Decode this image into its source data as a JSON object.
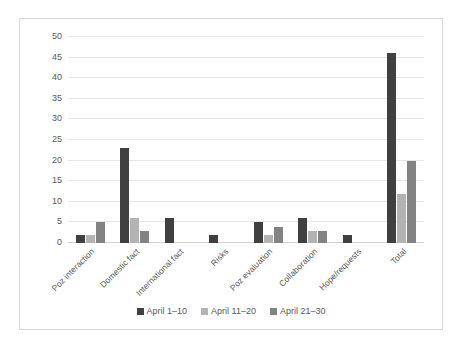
{
  "chart_data": {
    "type": "bar",
    "title": "",
    "subtitle": "",
    "xlabel": "",
    "ylabel": "",
    "ylim": [
      0,
      50
    ],
    "ytick_step": 5,
    "yticks": [
      50,
      45,
      40,
      35,
      30,
      25,
      20,
      15,
      10,
      5,
      0
    ],
    "grid": true,
    "legend_position": "bottom",
    "categories": [
      "Poz interaction",
      "Domestic fact",
      "International fact",
      "Risks",
      "Poz evaluation",
      "Collaboration",
      "Hope/requests",
      "Total"
    ],
    "series": [
      {
        "name": "April 1–10",
        "color": "#404040",
        "values": [
          2,
          23,
          6,
          2,
          5,
          6,
          2,
          46
        ]
      },
      {
        "name": "April 11–20",
        "color": "#b3b3b3",
        "values": [
          2,
          6,
          0,
          0,
          2,
          3,
          0,
          12
        ]
      },
      {
        "name": "April 21–30",
        "color": "#838383",
        "values": [
          5,
          3,
          0,
          0,
          4,
          3,
          0,
          20
        ]
      }
    ]
  },
  "colors": {
    "series_1": "#404040",
    "series_2": "#b3b3b3",
    "series_3": "#838383",
    "gridline": "#e6e6e6",
    "frame_border": "#d9d9d9",
    "tick_text": "#595959",
    "background": "#ffffff"
  }
}
